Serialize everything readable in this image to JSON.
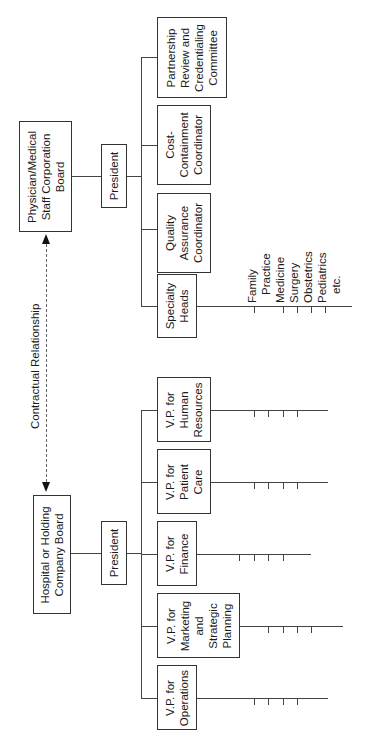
{
  "physician_org": {
    "board": "Physician/Medical\nStaff Corporation\nBoard",
    "president": "President",
    "units": [
      {
        "label": "Partnership\nReview and\nCredentialing\nCommittee"
      },
      {
        "label": "Cost-\nContainment\nCoordinator"
      },
      {
        "label": "Quality\nAssurance\nCoordinator"
      },
      {
        "label": "Specialty\nHeads"
      }
    ],
    "specialties": [
      "Family",
      "Practice",
      "Medicine",
      "Surgery",
      "Obstetrics",
      "Pediatrics",
      "etc."
    ]
  },
  "relationship": {
    "label": "Contractual Relationship"
  },
  "hospital_org": {
    "board": "Hospital or Holding\nCompany Board",
    "president": "President",
    "vps": [
      {
        "label": "V.P. for\nHuman\nResources"
      },
      {
        "label": "V.P. for\nPatient\nCare"
      },
      {
        "label": "V.P. for\nFinance"
      },
      {
        "label": "V.P. for\nMarketing\nand\nStrategic\nPlanning"
      },
      {
        "label": "V.P. for\nOperations"
      }
    ]
  }
}
